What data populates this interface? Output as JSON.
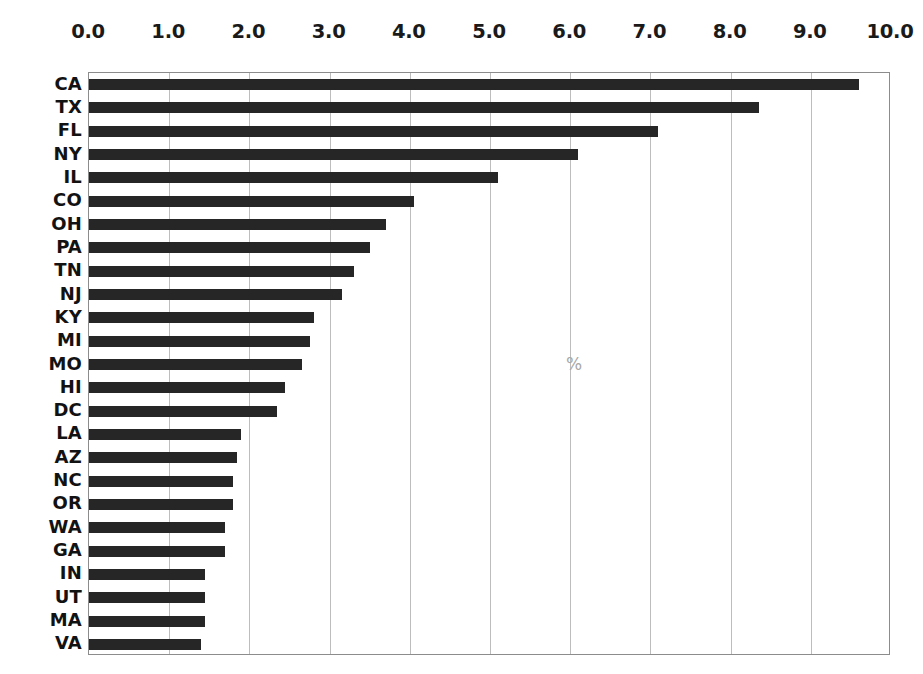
{
  "chart_data": {
    "type": "bar",
    "orientation": "horizontal",
    "title": "",
    "subtitle": "",
    "xlabel": "%",
    "ylabel": "",
    "xlim": [
      0.0,
      10.0
    ],
    "xticks": [
      "0.0",
      "1.0",
      "2.0",
      "3.0",
      "4.0",
      "5.0",
      "6.0",
      "7.0",
      "8.0",
      "9.0",
      "10.0"
    ],
    "xtick_values": [
      0,
      1,
      2,
      3,
      4,
      5,
      6,
      7,
      8,
      9,
      10
    ],
    "xaxis_position": "top",
    "grid": "vertical",
    "legend": "none",
    "annotations": [
      "%"
    ],
    "categories": [
      "CA",
      "TX",
      "FL",
      "NY",
      "IL",
      "CO",
      "OH",
      "PA",
      "TN",
      "NJ",
      "KY",
      "MI",
      "MO",
      "HI",
      "DC",
      "LA",
      "AZ",
      "NC",
      "OR",
      "WA",
      "GA",
      "IN",
      "UT",
      "MA",
      "VA"
    ],
    "values": [
      9.6,
      8.35,
      7.1,
      6.1,
      5.1,
      4.05,
      3.7,
      3.5,
      3.3,
      3.15,
      2.8,
      2.75,
      2.65,
      2.45,
      2.35,
      1.9,
      1.85,
      1.8,
      1.8,
      1.7,
      1.7,
      1.45,
      1.45,
      1.45,
      1.4
    ],
    "series": [
      {
        "name": "percent",
        "values": [
          9.6,
          8.35,
          7.1,
          6.1,
          5.1,
          4.05,
          3.7,
          3.5,
          3.3,
          3.15,
          2.8,
          2.75,
          2.65,
          2.45,
          2.35,
          1.9,
          1.85,
          1.8,
          1.8,
          1.7,
          1.7,
          1.45,
          1.45,
          1.45,
          1.4
        ]
      }
    ],
    "colors": {
      "bar": "#262626",
      "gridline": "#bdbdbd",
      "plot_border": "#8c8c8c",
      "tick_text": "#1a1a1a",
      "annotation_text": "#a8a8a8",
      "background": "#ffffff"
    }
  },
  "caption": {
    "text": "​"
  }
}
